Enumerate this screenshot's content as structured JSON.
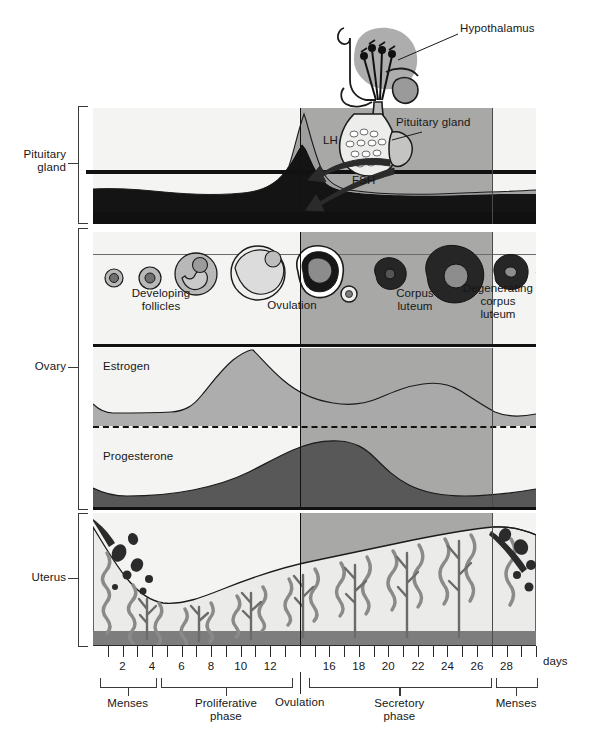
{
  "figure": {
    "axis_unit_label": "days"
  },
  "row_labels": [
    {
      "id": "pituitary",
      "label": "Pituitary\ngland"
    },
    {
      "id": "ovary",
      "label": "Ovary"
    },
    {
      "id": "uterus",
      "label": "Uterus"
    }
  ],
  "anatomy_labels": [
    {
      "id": "hypothalamus",
      "label": "Hypothalamus"
    },
    {
      "id": "pituitary-gland",
      "label": "Pituitary gland"
    }
  ],
  "hormone_labels": [
    {
      "id": "lh",
      "label": "LH"
    },
    {
      "id": "fsh",
      "label": "FSH"
    },
    {
      "id": "estrogen",
      "label": "Estrogen"
    },
    {
      "id": "progesterone",
      "label": "Progesterone"
    }
  ],
  "ovary_stage_labels": [
    {
      "id": "developing-follicles",
      "label": "Developing\nfollicles"
    },
    {
      "id": "ovulation",
      "label": "Ovulation"
    },
    {
      "id": "corpus-luteum",
      "label": "Corpus\nluteum"
    },
    {
      "id": "degenerating-corpus-luteum",
      "label": "Degenerating\ncorpus\nluteum"
    }
  ],
  "phases": [
    {
      "id": "menses-early",
      "label": "Menses",
      "start_day": 0.5,
      "end_day": 4.2
    },
    {
      "id": "proliferative",
      "label": "Proliferative\nphase",
      "start_day": 4.6,
      "end_day": 13.4
    },
    {
      "id": "ovulation",
      "label": "Ovulation",
      "start_day": 14,
      "end_day": 14
    },
    {
      "id": "secretory",
      "label": "Secretory\nphase",
      "start_day": 14.6,
      "end_day": 26.9
    },
    {
      "id": "menses-late",
      "label": "Menses",
      "start_day": 27.3,
      "end_day": 30
    }
  ],
  "axis": {
    "label": "days",
    "tick_days": [
      1,
      2,
      3,
      4,
      5,
      6,
      7,
      8,
      9,
      10,
      11,
      12,
      13,
      14,
      15,
      16,
      17,
      18,
      19,
      20,
      21,
      22,
      23,
      24,
      25,
      26,
      27,
      28,
      29,
      30
    ],
    "labeled_ticks": [
      {
        "day": 2,
        "text": "2"
      },
      {
        "day": 4,
        "text": "4"
      },
      {
        "day": 6,
        "text": "6"
      },
      {
        "day": 8,
        "text": "8"
      },
      {
        "day": 10,
        "text": "10"
      },
      {
        "day": 12,
        "text": "12"
      },
      {
        "day": 16,
        "text": "16"
      },
      {
        "day": 18,
        "text": "18"
      },
      {
        "day": 20,
        "text": "20"
      },
      {
        "day": 22,
        "text": "22"
      },
      {
        "day": 24,
        "text": "24"
      },
      {
        "day": 26,
        "text": "26"
      },
      {
        "day": 28,
        "text": "28"
      }
    ],
    "range_days": [
      0,
      30
    ]
  },
  "colors": {
    "shade_secretory": "#9a9a9a",
    "panel_light": "#f4f4f2",
    "lh_fill": "#9d9d9d",
    "fsh_fill": "#171717",
    "estrogen_fill": "#a8a8a8",
    "progesterone_fill": "#555555",
    "endometrium": "#e9e9e7",
    "gland": "#6e6e6e",
    "stroke": "#111111"
  },
  "chart_data": [
    {
      "type": "area",
      "id": "pituitary-hormones",
      "title": "Pituitary gland hormones",
      "xlabel": "days",
      "ylabel": "",
      "xlim": [
        0,
        30
      ],
      "grid": false,
      "series": [
        {
          "name": "LH",
          "x": [
            0,
            2,
            4,
            6,
            8,
            10,
            11,
            12,
            13,
            13.6,
            14,
            14.4,
            15,
            16,
            17,
            18,
            20,
            24,
            28,
            30
          ],
          "values": [
            0.12,
            0.12,
            0.12,
            0.12,
            0.13,
            0.15,
            0.2,
            0.32,
            0.62,
            0.9,
            1.0,
            0.82,
            0.45,
            0.26,
            0.2,
            0.17,
            0.14,
            0.13,
            0.13,
            0.13
          ]
        },
        {
          "name": "FSH",
          "x": [
            0,
            2,
            4,
            6,
            8,
            10,
            12,
            13,
            13.6,
            14,
            14.4,
            15,
            16,
            18,
            22,
            26,
            28,
            30
          ],
          "values": [
            0.3,
            0.31,
            0.3,
            0.28,
            0.26,
            0.27,
            0.33,
            0.45,
            0.62,
            0.72,
            0.55,
            0.32,
            0.22,
            0.18,
            0.17,
            0.22,
            0.27,
            0.28
          ]
        }
      ]
    },
    {
      "type": "area",
      "id": "ovarian-hormones",
      "title": "Ovarian hormones",
      "xlabel": "days",
      "xlim": [
        0,
        30
      ],
      "grid": false,
      "series": [
        {
          "name": "Estrogen",
          "x": [
            0,
            1,
            2,
            4,
            6,
            7,
            8,
            9,
            10,
            11,
            12,
            13,
            14,
            15,
            16,
            17,
            18,
            19,
            20,
            21,
            22,
            23,
            24,
            25,
            26,
            27,
            28,
            29,
            30
          ],
          "values": [
            0.3,
            0.22,
            0.18,
            0.17,
            0.17,
            0.18,
            0.22,
            0.32,
            0.45,
            0.6,
            0.76,
            0.9,
            0.97,
            0.9,
            0.76,
            0.62,
            0.52,
            0.47,
            0.46,
            0.49,
            0.55,
            0.62,
            0.68,
            0.7,
            0.66,
            0.52,
            0.33,
            0.24,
            0.22
          ]
        },
        {
          "name": "Progesterone",
          "x": [
            0,
            2,
            4,
            6,
            8,
            10,
            12,
            13,
            14,
            15,
            16,
            17,
            18,
            19,
            20,
            21,
            22,
            23,
            24,
            25,
            26,
            27,
            28,
            29,
            30
          ],
          "values": [
            0.16,
            0.1,
            0.08,
            0.08,
            0.09,
            0.11,
            0.16,
            0.22,
            0.32,
            0.46,
            0.6,
            0.72,
            0.82,
            0.88,
            0.9,
            0.88,
            0.82,
            0.72,
            0.6,
            0.47,
            0.36,
            0.27,
            0.21,
            0.17,
            0.15
          ]
        }
      ]
    },
    {
      "type": "area",
      "id": "endometrium-thickness",
      "title": "Uterine endometrium thickness",
      "xlabel": "days",
      "xlim": [
        0,
        30
      ],
      "grid": false,
      "series": [
        {
          "name": "Endometrium",
          "x": [
            0,
            1,
            2,
            3,
            4,
            5,
            6,
            8,
            10,
            12,
            14,
            16,
            18,
            20,
            22,
            24,
            26,
            27,
            28,
            29,
            30
          ],
          "values": [
            0.88,
            0.7,
            0.48,
            0.3,
            0.22,
            0.24,
            0.28,
            0.36,
            0.44,
            0.52,
            0.6,
            0.66,
            0.72,
            0.78,
            0.84,
            0.9,
            0.94,
            0.92,
            0.86,
            0.84,
            0.88
          ]
        }
      ]
    }
  ]
}
